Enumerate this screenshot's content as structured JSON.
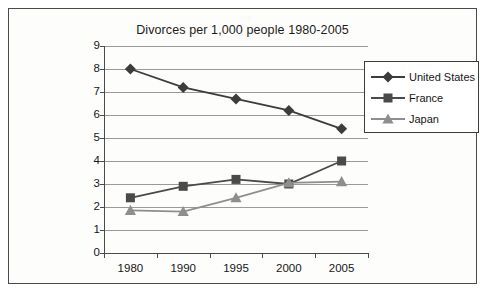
{
  "chart_data": {
    "type": "line",
    "title": "Divorces per 1,000 people 1980-2005",
    "xlabel": "",
    "ylabel": "",
    "categories": [
      "1980",
      "1990",
      "1995",
      "2000",
      "2005"
    ],
    "ylim": [
      0,
      9
    ],
    "ytick_labels": [
      "0",
      "1",
      "2",
      "3",
      "4",
      "5",
      "6",
      "7",
      "8",
      "9"
    ],
    "grid": "horizontal",
    "legend_position": "top-right",
    "series": [
      {
        "name": "United States",
        "marker": "diamond",
        "color": "#3c3c3c",
        "values": [
          8.0,
          7.2,
          6.7,
          6.2,
          5.4
        ]
      },
      {
        "name": "France",
        "marker": "square",
        "color": "#4a4a4a",
        "values": [
          2.4,
          2.9,
          3.2,
          3.0,
          4.0
        ]
      },
      {
        "name": "Japan",
        "marker": "triangle",
        "color": "#8e8e8e",
        "values": [
          1.85,
          1.8,
          2.4,
          3.05,
          3.1
        ]
      }
    ]
  }
}
